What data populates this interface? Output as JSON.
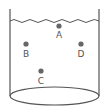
{
  "diagram": {
    "colors": {
      "stroke": "#555555",
      "point": "#666666",
      "label": "#555555",
      "background": "#ffffff"
    },
    "points": [
      {
        "id": "A",
        "label": "A",
        "x": 59,
        "y": 26
      },
      {
        "id": "B",
        "label": "B",
        "x": 26,
        "y": 44
      },
      {
        "id": "D",
        "label": "D",
        "x": 81,
        "y": 44
      },
      {
        "id": "C",
        "label": "C",
        "x": 41,
        "y": 71
      }
    ]
  }
}
